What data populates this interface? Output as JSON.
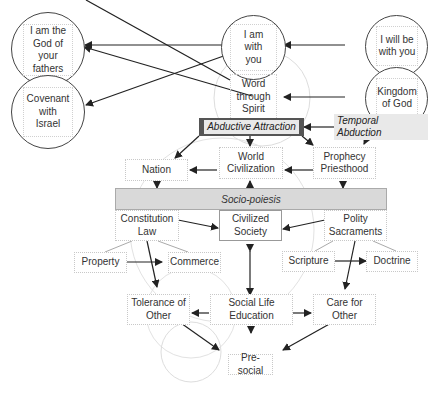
{
  "diagram": {
    "top_left": {
      "god_of_fathers": "I am the\nGod of\nyour\nfathers",
      "covenant": "Covenant\nwith\nIsrael"
    },
    "top_center": {
      "i_am_with_you": "I am\nwith\nyou",
      "word_through_spirit": "Word\nthrough\nSpirit"
    },
    "top_right": {
      "i_will_be_with_you": "I will be\nwith you",
      "kingdom_of_god": "Kingdom\nof God"
    },
    "abductive_attraction": "Abductive Attraction",
    "temporal_abduction": "Temporal Abduction",
    "nation": "Nation",
    "world_civilization": "World\nCivilization",
    "prophecy_priesthood": "Prophecy\nPriesthood",
    "socio_poiesis": "Socio-poiesis",
    "constitution_law": "Constitution\nLaw",
    "civilized_society": "Civilized\nSociety",
    "polity_sacraments": "Polity\nSacraments",
    "property": "Property",
    "commerce": "Commerce",
    "scripture": "Scripture",
    "doctrine": "Doctrine",
    "tolerance_of_other": "Tolerance of\nOther",
    "social_life_education": "Social Life\nEducation",
    "care_for_other": "Care for\nOther",
    "pre_social": "Pre-social"
  },
  "colors": {
    "dark_label_bg": "#555555",
    "band_bg": "#d9d9d9",
    "arrow": "#222222"
  }
}
